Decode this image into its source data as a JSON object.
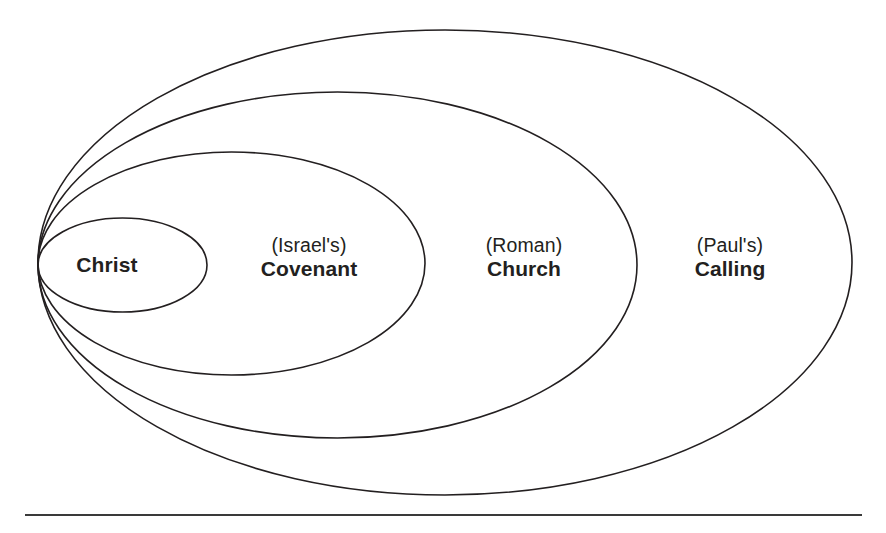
{
  "diagram": {
    "type": "nested-ellipses",
    "colors": {
      "background": "#ffffff",
      "stroke": "#231f20",
      "rule": "#3a3a3a",
      "text": "#231f20"
    },
    "rings": [
      {
        "id": "christ",
        "qualifier": "",
        "term": "Christ",
        "level": 1,
        "cx": 122.5,
        "cy": 265,
        "rx": 84.5,
        "ry": 47,
        "label_x": 107,
        "label_y": 265
      },
      {
        "id": "covenant",
        "qualifier": "(Israel's)",
        "term": "Covenant",
        "level": 2,
        "cx": 231.5,
        "cy": 263.5,
        "rx": 193.5,
        "ry": 111.5,
        "label_x": 309,
        "label_y": 258
      },
      {
        "id": "church",
        "qualifier": "(Roman)",
        "term": "Church",
        "level": 3,
        "cx": 337.5,
        "cy": 265,
        "rx": 299.5,
        "ry": 173,
        "label_x": 524,
        "label_y": 258
      },
      {
        "id": "calling",
        "qualifier": "(Paul's)",
        "term": "Calling",
        "level": 4,
        "cx": 445,
        "cy": 262.5,
        "rx": 407,
        "ry": 232.5,
        "label_x": 730,
        "label_y": 258
      }
    ],
    "baseline_rule": {
      "name": "horizontal-rule",
      "x1": 25,
      "y1": 515,
      "x2": 862,
      "y2": 515
    }
  }
}
